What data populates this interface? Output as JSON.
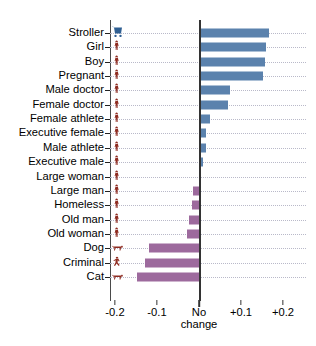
{
  "chart_data": {
    "type": "bar",
    "orientation": "horizontal",
    "title": "",
    "xlabel": "",
    "ylabel": "",
    "xlim": [
      -0.212,
      0.255
    ],
    "xticks": [
      -0.2,
      -0.1,
      0,
      0.1,
      0.2
    ],
    "xtick_labels": [
      "-0.2",
      "-0.1",
      "No change",
      "+0.1",
      "+0.2"
    ],
    "zero_tick_label_lines": [
      "No",
      "change"
    ],
    "grid": "dotted-horizontal",
    "legend": null,
    "positive_color": "#5b82ad",
    "negative_color": "#9d6a9d",
    "categories": [
      "Stroller",
      "Girl",
      "Boy",
      "Pregnant",
      "Male doctor",
      "Female doctor",
      "Female athlete",
      "Executive female",
      "Male athlete",
      "Executive male",
      "Large woman",
      "Large man",
      "Homeless",
      "Old man",
      "Old woman",
      "Dog",
      "Criminal",
      "Cat"
    ],
    "values": [
      0.167,
      0.159,
      0.156,
      0.153,
      0.074,
      0.07,
      0.026,
      0.016,
      0.016,
      0.009,
      0.004,
      -0.014,
      -0.016,
      -0.024,
      -0.028,
      -0.119,
      -0.129,
      -0.148
    ],
    "icons": [
      "stroller-pictogram",
      "girl-pictogram",
      "boy-pictogram",
      "pregnant-pictogram",
      "male-doctor-pictogram",
      "female-doctor-pictogram",
      "female-athlete-pictogram",
      "executive-female-pictogram",
      "male-athlete-pictogram",
      "executive-male-pictogram",
      "large-woman-pictogram",
      "large-man-pictogram",
      "homeless-pictogram",
      "old-man-pictogram",
      "old-woman-pictogram",
      "dog-pictogram",
      "criminal-pictogram",
      "cat-pictogram"
    ]
  }
}
